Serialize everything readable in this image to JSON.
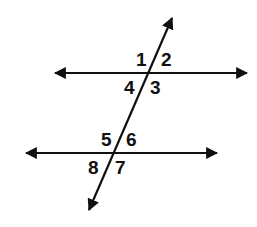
{
  "diagram": {
    "colors": {
      "stroke": "#111111",
      "background": "#ffffff"
    },
    "lines": [
      {
        "id": "parallel-top",
        "x1": 52,
        "y1": 73,
        "x2": 250,
        "y2": 73,
        "arrows": "both"
      },
      {
        "id": "parallel-bottom",
        "x1": 23,
        "y1": 153,
        "x2": 220,
        "y2": 153,
        "arrows": "both"
      },
      {
        "id": "transversal",
        "x1": 88,
        "y1": 213,
        "x2": 173,
        "y2": 15,
        "arrows": "both"
      }
    ],
    "angle_labels": [
      {
        "text": "1",
        "x": 136,
        "y": 66
      },
      {
        "text": "2",
        "x": 161,
        "y": 66
      },
      {
        "text": "4",
        "x": 124,
        "y": 94
      },
      {
        "text": "3",
        "x": 150,
        "y": 94
      },
      {
        "text": "5",
        "x": 101,
        "y": 146
      },
      {
        "text": "6",
        "x": 126,
        "y": 146
      },
      {
        "text": "8",
        "x": 88,
        "y": 174
      },
      {
        "text": "7",
        "x": 115,
        "y": 174
      }
    ]
  }
}
